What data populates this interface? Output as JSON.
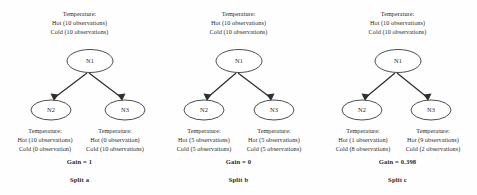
{
  "figure": {
    "background_color": "#fefefe",
    "text_color": "#2b2b2b",
    "node_stroke_color": "#3a3a3a",
    "edge_color": "#2f2f2f"
  },
  "panels": [
    {
      "id": "split-a",
      "root": {
        "node_name": "N1",
        "attribute_line": "Temperature:",
        "hot_line": "Hot (10 observations)",
        "cold_line": "Cold (10 observations)"
      },
      "left_child": {
        "node_name": "N2",
        "attribute_line": "Temperature:",
        "hot_line": "Hot (10 observations)",
        "cold_line": "Cold (0 observation)"
      },
      "right_child": {
        "node_name": "N3",
        "attribute_line": "Temperature:",
        "hot_line": "Hot (0 observation)",
        "cold_line": "Cold (10 observations)"
      },
      "gain_label": "Gain = 1",
      "split_label": "Split a"
    },
    {
      "id": "split-b",
      "root": {
        "node_name": "N1",
        "attribute_line": "Temperature:",
        "hot_line": "Hot (10 observations)",
        "cold_line": "Cold (10 observations)"
      },
      "left_child": {
        "node_name": "N2",
        "attribute_line": "Temperature:",
        "hot_line": "Hot (5 observations)",
        "cold_line": "Cold (5 observations)"
      },
      "right_child": {
        "node_name": "N3",
        "attribute_line": "Temperature:",
        "hot_line": "Hot (5 observations)",
        "cold_line": "Cold (5 observations)"
      },
      "gain_label": "Gain = 0",
      "split_label": "Split b"
    },
    {
      "id": "split-c",
      "root": {
        "node_name": "N1",
        "attribute_line": "Temperature:",
        "hot_line": "Hot (10 observations)",
        "cold_line": "Cold (10 observations)"
      },
      "left_child": {
        "node_name": "N2",
        "attribute_line": "Temperature:",
        "hot_line": "Hot (1 observation)",
        "cold_line": "Cold (8 observations)"
      },
      "right_child": {
        "node_name": "N3",
        "attribute_line": "Temperature:",
        "hot_line": "Hot (9 observations)",
        "cold_line": "Cold (2 observations)"
      },
      "gain_label": "Gain = 0.398",
      "split_label": "Split c"
    }
  ]
}
